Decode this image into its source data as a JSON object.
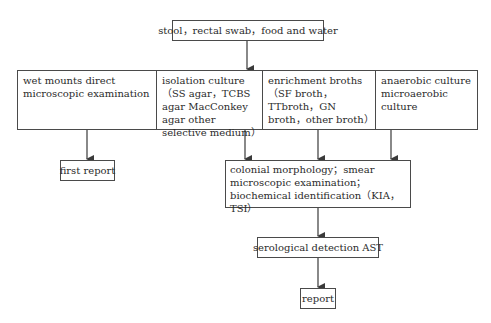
{
  "diagram": {
    "type": "flowchart",
    "source_node": {
      "label": "stool，rectal swab，food and water"
    },
    "methods": [
      {
        "label": "wet mounts direct microscopic examination"
      },
      {
        "label": "isolation culture（SS agar，TCBS agar MacConkey agar other selective medium）"
      },
      {
        "label": "enrichment broths（SF broth，TTbroth，GN broth，other broth）"
      },
      {
        "label": "anaerobic culture microaerobic  culture"
      }
    ],
    "first_report": {
      "label": "first report"
    },
    "identification": {
      "label": "colonial morphology；smear microscopic examination；biochemical identification（KIA，TSI）"
    },
    "serology": {
      "label": "serological detection AST"
    },
    "final_report": {
      "label": "report"
    },
    "edges": [
      {
        "from": "source_node",
        "to": "methods"
      },
      {
        "from": "methods.0",
        "to": "first_report"
      },
      {
        "from": "methods.1",
        "to": "identification"
      },
      {
        "from": "methods.2",
        "to": "identification"
      },
      {
        "from": "methods.3",
        "to": "identification"
      },
      {
        "from": "identification",
        "to": "serology"
      },
      {
        "from": "serology",
        "to": "final_report"
      }
    ],
    "colors": {
      "line": "#3a3a3a",
      "text": "#2b2b2b",
      "background": "#ffffff"
    }
  }
}
